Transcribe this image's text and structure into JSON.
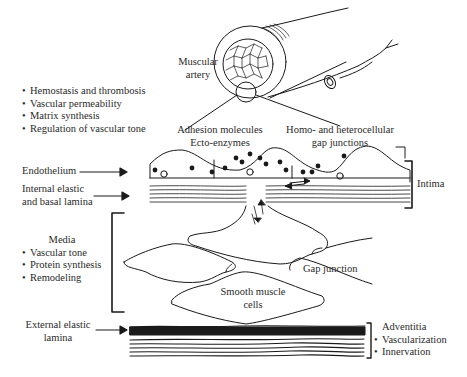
{
  "title_labels": {
    "muscular_artery": [
      "Muscular",
      "artery"
    ]
  },
  "endothelium_functions": {
    "items": [
      "Hemostasis and thrombosis",
      "Vascular permeability",
      "Matrix synthesis",
      "Regulation of vascular tone"
    ]
  },
  "callouts": {
    "adhesion": [
      "Adhesion molecules",
      "Ecto-enzymes"
    ],
    "gap_junctions": [
      "Homo- and heterocellular",
      "gap junctions"
    ]
  },
  "layers": {
    "endothelium": "Endothelium",
    "internal_elastic": [
      "Internal elastic",
      "and basal lamina"
    ],
    "intima": "Intima",
    "media": {
      "title": "Media",
      "items": [
        "Vascular tone",
        "Protein synthesis",
        "Remodeling"
      ]
    },
    "gap_junction": "Gap junction",
    "smooth_muscle": [
      "Smooth muscle",
      "cells"
    ],
    "external_elastic": [
      "External elastic",
      "lamina"
    ],
    "adventitia": {
      "title": "Adventitia",
      "items": [
        "Vascularization",
        "Innervation"
      ]
    }
  },
  "colors": {
    "ink": "#1a1a1a",
    "text": "#2a2a2a",
    "background": "#ffffff"
  }
}
